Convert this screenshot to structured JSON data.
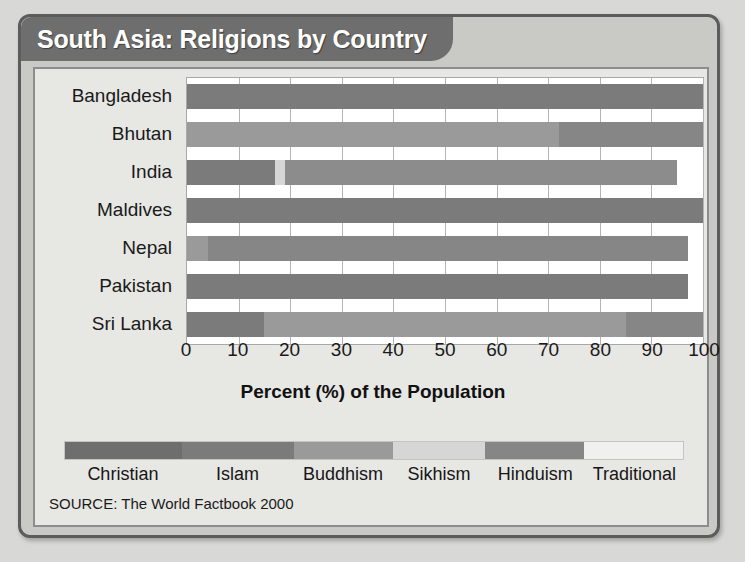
{
  "poster": {
    "title": "South Asia: Religions by Country",
    "source": "SOURCE: The World Factbook 2000"
  },
  "chart_data": {
    "type": "bar",
    "orientation": "horizontal",
    "stacked": true,
    "title": "South Asia: Religions by Country",
    "xlabel": "Percent (%) of the Population",
    "ylabel": "",
    "xlim": [
      0,
      100
    ],
    "xticks": [
      "0",
      "10",
      "20",
      "30",
      "40",
      "50",
      "60",
      "70",
      "80",
      "90",
      "100"
    ],
    "grid": true,
    "legend_position": "bottom",
    "categories": [
      "Bangladesh",
      "Bhutan",
      "India",
      "Maldives",
      "Nepal",
      "Pakistan",
      "Sri Lanka"
    ],
    "series": [
      {
        "name": "Christian",
        "color": "#6e6e6e",
        "values": [
          0,
          0,
          0,
          0,
          0,
          0,
          0
        ]
      },
      {
        "name": "Islam",
        "color": "#7b7b7b",
        "values": [
          100,
          0,
          17,
          100,
          0,
          97,
          15
        ]
      },
      {
        "name": "Buddhism",
        "color": "#9a9a9a",
        "values": [
          0,
          72,
          0,
          0,
          4,
          0,
          70
        ]
      },
      {
        "name": "Sikhism",
        "color": "#d6d6d6",
        "values": [
          0,
          0,
          2,
          0,
          0,
          0,
          0
        ]
      },
      {
        "name": "Hinduism",
        "color": "#868686",
        "values": [
          0,
          28,
          76,
          0,
          93,
          0,
          15
        ]
      },
      {
        "name": "Traditional",
        "color": "#f0f0ee",
        "values": [
          0,
          0,
          0,
          0,
          0,
          0,
          0
        ]
      }
    ],
    "bars": [
      {
        "country": "Bangladesh",
        "segments": [
          {
            "religion": "Islam",
            "start": 0,
            "end": 100,
            "color": "#7b7b7b"
          }
        ]
      },
      {
        "country": "Bhutan",
        "segments": [
          {
            "religion": "Buddhism",
            "start": 0,
            "end": 72,
            "color": "#9a9a9a"
          },
          {
            "religion": "Hinduism",
            "start": 72,
            "end": 100,
            "color": "#868686"
          }
        ]
      },
      {
        "country": "India",
        "segments": [
          {
            "religion": "Islam",
            "start": 0,
            "end": 17,
            "color": "#7b7b7b"
          },
          {
            "religion": "Sikhism",
            "start": 17,
            "end": 19,
            "color": "#d6d6d6"
          },
          {
            "religion": "Hinduism",
            "start": 19,
            "end": 95,
            "color": "#8c8c8c"
          }
        ]
      },
      {
        "country": "Maldives",
        "segments": [
          {
            "religion": "Islam",
            "start": 0,
            "end": 100,
            "color": "#7b7b7b"
          }
        ]
      },
      {
        "country": "Nepal",
        "segments": [
          {
            "religion": "Buddhism",
            "start": 0,
            "end": 4,
            "color": "#9a9a9a"
          },
          {
            "religion": "Hinduism",
            "start": 4,
            "end": 97,
            "color": "#868686"
          }
        ]
      },
      {
        "country": "Pakistan",
        "segments": [
          {
            "religion": "Islam",
            "start": 0,
            "end": 97,
            "color": "#7b7b7b"
          }
        ]
      },
      {
        "country": "Sri Lanka",
        "segments": [
          {
            "religion": "Islam",
            "start": 0,
            "end": 15,
            "color": "#7b7b7b"
          },
          {
            "religion": "Buddhism",
            "start": 15,
            "end": 85,
            "color": "#9a9a9a"
          },
          {
            "religion": "Hinduism",
            "start": 85,
            "end": 100,
            "color": "#868686"
          }
        ]
      }
    ],
    "legend": [
      {
        "label": "Christian",
        "color": "#6e6e6e",
        "width_pct": 19
      },
      {
        "label": "Islam",
        "color": "#7b7b7b",
        "width_pct": 18
      },
      {
        "label": "Buddhism",
        "color": "#9a9a9a",
        "width_pct": 16
      },
      {
        "label": "Sikhism",
        "color": "#d6d6d6",
        "width_pct": 15
      },
      {
        "label": "Hinduism",
        "color": "#868686",
        "width_pct": 16
      },
      {
        "label": "Traditional",
        "color": "#f0f0ee",
        "width_pct": 16
      }
    ]
  }
}
